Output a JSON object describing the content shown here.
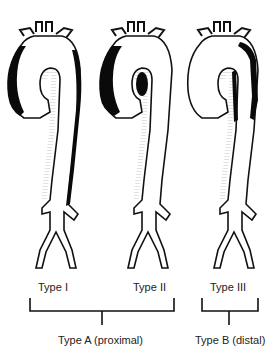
{
  "diagram": {
    "panels": [
      {
        "label": "Type I",
        "dissection": "ascending and descending aorta"
      },
      {
        "label": "Type II",
        "dissection": "ascending aorta only"
      },
      {
        "label": "Type III",
        "dissection": "descending aorta only"
      }
    ],
    "groups": [
      {
        "label": "Type A (proximal)",
        "spans": [
          "Type I",
          "Type II"
        ]
      },
      {
        "label": "Type B (distal)",
        "spans": [
          "Type III"
        ]
      }
    ],
    "colors": {
      "line": "#111111",
      "false_lumen": "#0a0a0a",
      "background": "#ffffff"
    }
  }
}
